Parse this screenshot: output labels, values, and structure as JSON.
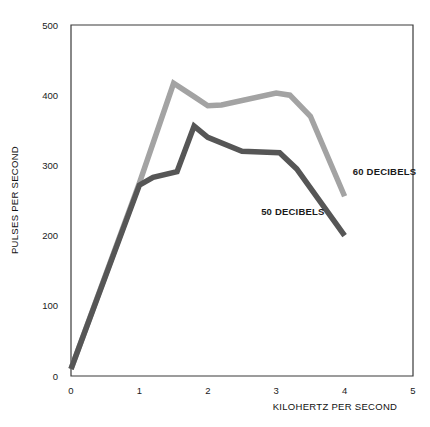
{
  "chart_data": {
    "type": "line",
    "title": "",
    "subtitle": "",
    "xlabel": "KILOHERTZ PER SECOND",
    "ylabel": "PULSES PER SECOND",
    "xlim": [
      0,
      5
    ],
    "ylim": [
      0,
      500
    ],
    "xticks": [
      "0",
      "1",
      "2",
      "3",
      "4",
      "5"
    ],
    "xtick_values": [
      0,
      1,
      2,
      3,
      4,
      5
    ],
    "yticks": [
      "0",
      "100",
      "200",
      "300",
      "400",
      "500"
    ],
    "ytick_values": [
      0,
      100,
      200,
      300,
      400,
      500
    ],
    "grid": false,
    "legend_position": "inline-annotation",
    "series": [
      {
        "name": "60 DECIBELS",
        "color": "#a3a3a3",
        "stroke_width": 5.5,
        "x": [
          0,
          1,
          1.5,
          1.8,
          2.0,
          2.2,
          3.0,
          3.2,
          3.5,
          4.0
        ],
        "values": [
          10,
          275,
          417,
          398,
          385,
          386,
          403,
          400,
          370,
          256
        ],
        "label": "60 DECIBELS",
        "label_x": 4.12,
        "label_y": 287
      },
      {
        "name": "50 DECIBELS",
        "color": "#565656",
        "stroke_width": 5.5,
        "x": [
          0,
          1,
          1.2,
          1.55,
          1.8,
          2.0,
          2.5,
          3.05,
          3.3,
          4.0
        ],
        "values": [
          10,
          272,
          283,
          291,
          356,
          340,
          320,
          318,
          295,
          200
        ],
        "label": "50 DECIBELS",
        "label_x": 2.78,
        "label_y": 230
      }
    ],
    "annotations": [
      {
        "text": "60 DECIBELS",
        "x": 4.12,
        "y": 287
      },
      {
        "text": "50 DECIBELS",
        "x": 2.78,
        "y": 230
      }
    ],
    "axis_color": "#3a3a3a",
    "background_color": "#ffffff"
  }
}
